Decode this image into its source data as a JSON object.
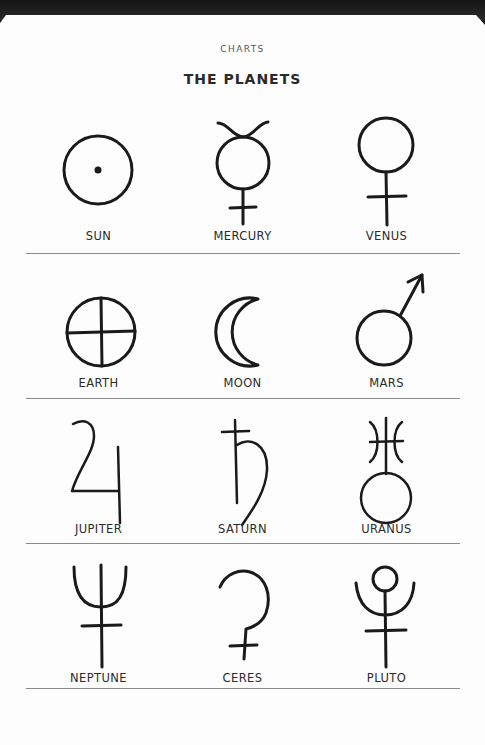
{
  "page": {
    "section_label": "CHARTS",
    "title": "THE PLANETS"
  },
  "rows": [
    {
      "planets": [
        {
          "name": "SUN",
          "icon": "sun-symbol-icon"
        },
        {
          "name": "MERCURY",
          "icon": "mercury-symbol-icon"
        },
        {
          "name": "VENUS",
          "icon": "venus-symbol-icon"
        }
      ]
    },
    {
      "planets": [
        {
          "name": "EARTH",
          "icon": "earth-symbol-icon"
        },
        {
          "name": "MOON",
          "icon": "moon-symbol-icon"
        },
        {
          "name": "MARS",
          "icon": "mars-symbol-icon"
        }
      ]
    },
    {
      "planets": [
        {
          "name": "JUPITER",
          "icon": "jupiter-symbol-icon"
        },
        {
          "name": "SATURN",
          "icon": "saturn-symbol-icon"
        },
        {
          "name": "URANUS",
          "icon": "uranus-symbol-icon"
        }
      ]
    },
    {
      "planets": [
        {
          "name": "NEPTUNE",
          "icon": "neptune-symbol-icon"
        },
        {
          "name": "CERES",
          "icon": "ceres-symbol-icon"
        },
        {
          "name": "PLUTO",
          "icon": "pluto-symbol-icon"
        }
      ]
    }
  ],
  "colors": {
    "ink": "#1a1a1a",
    "paper": "#fdfdfd",
    "divider": "#8a8a8a",
    "background": "#1c1c1c"
  }
}
